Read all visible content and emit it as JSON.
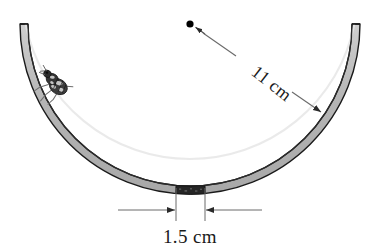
{
  "figure": {
    "background_color": "#ffffff",
    "width": 380,
    "height": 251
  },
  "bowl": {
    "name": "bowl-cross-section",
    "shape": "semicircular-arc",
    "wall_fill_color": "#b9b9b9",
    "wall_outline_color": "#1a1a1a",
    "highlight_color": "#e4e4e4",
    "center_x": 190,
    "center_y": 24,
    "outer_radius": 170,
    "wall_thickness": 8,
    "rim_left_x": 22,
    "rim_right_x": 358,
    "rim_top_y": 22,
    "bottom_y": 194
  },
  "rough_patch": {
    "name": "rough-bottom-patch",
    "color": "#262626",
    "start_x": 176,
    "end_x": 205,
    "label": "1.5 cm"
  },
  "radius_annotation": {
    "name": "radius-dimension",
    "label": "11 cm",
    "label_rotation_deg": 38,
    "center_dot_x": 190,
    "center_dot_y": 24,
    "arrow_tip_x": 322,
    "arrow_tip_y": 113,
    "line_color": "#4a4a4a",
    "dot_color": "#000000"
  },
  "width_annotation": {
    "name": "width-dimension",
    "label": "1.5 cm",
    "dimension_line_y": 210,
    "left_extent_x": 118,
    "right_extent_x": 262,
    "left_tick_x": 176,
    "right_tick_x": 205,
    "line_color": "#4a4a4a",
    "text_x": 190,
    "text_y": 243
  },
  "insect": {
    "name": "insect-on-bowl-wall",
    "kind": "fly",
    "body_color": "#3a3a3a",
    "marking_color": "#d8d8d8",
    "leg_color": "#707070",
    "position_x": 57,
    "position_y": 84,
    "rotation_deg": 32
  }
}
